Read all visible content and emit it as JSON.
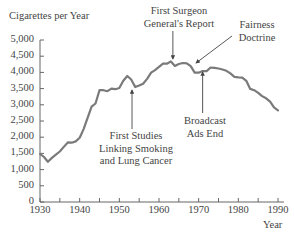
{
  "chart_data": {
    "type": "line",
    "title": "",
    "ylabel": "Cigarettes per Year",
    "xlabel": "Year",
    "xlim": [
      1930,
      1990
    ],
    "ylim": [
      0,
      5000
    ],
    "grid": false,
    "legend": null,
    "x_ticks": [
      1930,
      1940,
      1950,
      1960,
      1970,
      1980,
      1990
    ],
    "x_tick_labels": [
      "1930",
      "1940",
      "1950",
      "1960",
      "1970",
      "1980",
      "1990"
    ],
    "x_minor_ticks": [
      1935,
      1945,
      1955,
      1965,
      1975,
      1985
    ],
    "y_ticks": [
      0,
      500,
      1000,
      1500,
      2000,
      2500,
      3000,
      3500,
      4000,
      4500,
      5000
    ],
    "y_tick_labels": [
      "0",
      "500",
      "1,000",
      "1,500",
      "2,000",
      "2,500",
      "3,000",
      "3,500",
      "4,000",
      "4,500",
      "5,000"
    ],
    "series": [
      {
        "name": "Cigarettes per Year",
        "color": "#7a7a7a",
        "x": [
          1930,
          1931,
          1932,
          1933,
          1934,
          1935,
          1936,
          1937,
          1938,
          1939,
          1940,
          1941,
          1942,
          1943,
          1944,
          1945,
          1946,
          1947,
          1948,
          1949,
          1950,
          1951,
          1952,
          1953,
          1954,
          1955,
          1956,
          1957,
          1958,
          1959,
          1960,
          1961,
          1962,
          1963,
          1964,
          1965,
          1966,
          1967,
          1968,
          1969,
          1970,
          1971,
          1972,
          1973,
          1974,
          1975,
          1976,
          1977,
          1978,
          1979,
          1980,
          1981,
          1982,
          1983,
          1984,
          1985,
          1986,
          1987,
          1988,
          1989,
          1990
        ],
        "values": [
          1485,
          1390,
          1240,
          1360,
          1460,
          1560,
          1700,
          1840,
          1830,
          1870,
          1980,
          2250,
          2600,
          2940,
          3040,
          3450,
          3450,
          3420,
          3500,
          3480,
          3520,
          3740,
          3890,
          3780,
          3550,
          3600,
          3650,
          3800,
          3990,
          4070,
          4170,
          4270,
          4270,
          4340,
          4200,
          4260,
          4290,
          4280,
          4190,
          3990,
          3990,
          4040,
          4040,
          4150,
          4140,
          4120,
          4090,
          4050,
          3970,
          3860,
          3850,
          3840,
          3740,
          3490,
          3450,
          3370,
          3270,
          3200,
          3100,
          2920,
          2830
        ]
      }
    ],
    "annotations": [
      {
        "text": "First Studies Linking Smoking and Lung Cancer",
        "year": 1953,
        "arrow_direction": "up"
      },
      {
        "text": "First Surgeon General's Report",
        "year": 1964,
        "arrow_direction": "down"
      },
      {
        "text": "Fairness Doctrine",
        "year": 1967,
        "arrow_direction": "down-left"
      },
      {
        "text": "Broadcast Ads End",
        "year": 1971,
        "arrow_direction": "up"
      }
    ]
  },
  "labels": {
    "y_axis_title": "Cigarettes per Year",
    "x_axis_title": "Year",
    "ann_first_studies": [
      "First Studies",
      "Linking Smoking",
      "and Lung Cancer"
    ],
    "ann_surgeon": [
      "First Surgeon",
      "General's Report"
    ],
    "ann_fairness": [
      "Fairness",
      "Doctrine"
    ],
    "ann_broadcast": [
      "Broadcast",
      "Ads End"
    ]
  }
}
